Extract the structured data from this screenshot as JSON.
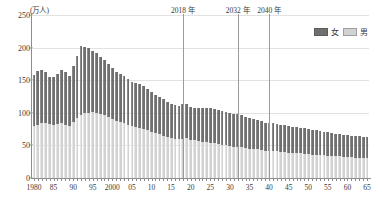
{
  "chart_data": {
    "type": "bar",
    "stacked": true,
    "title": "",
    "subtitle": "",
    "unit_label": "(万人)",
    "xlabel": "",
    "ylabel": "",
    "ylim": [
      0,
      250
    ],
    "yticks": [
      0,
      50,
      100,
      150,
      200,
      250
    ],
    "ytick_labels": [
      "0",
      "50",
      "100",
      "150",
      "200",
      "250"
    ],
    "grid": true,
    "legend_position": "top-right",
    "legend": [
      "女",
      "男"
    ],
    "colors": {
      "female": "#6f6f6f",
      "male": "#d2d2d2",
      "axis": "#8d8d8d",
      "grid": "#e2e2e2",
      "text": "#3a3a3a"
    },
    "x": [
      1980,
      1981,
      1982,
      1983,
      1984,
      1985,
      1986,
      1987,
      1988,
      1989,
      1990,
      1991,
      1992,
      1993,
      1994,
      1995,
      1996,
      1997,
      1998,
      1999,
      2000,
      2001,
      2002,
      2003,
      2004,
      2005,
      2006,
      2007,
      2008,
      2009,
      2010,
      2011,
      2012,
      2013,
      2014,
      2015,
      2016,
      2017,
      2018,
      2019,
      2020,
      2021,
      2022,
      2023,
      2024,
      2025,
      2026,
      2027,
      2028,
      2029,
      2030,
      2031,
      2032,
      2033,
      2034,
      2035,
      2036,
      2037,
      2038,
      2039,
      2040,
      2041,
      2042,
      2043,
      2044,
      2045,
      2046,
      2047,
      2048,
      2049,
      2050,
      2051,
      2052,
      2053,
      2054,
      2055,
      2056,
      2057,
      2058,
      2059,
      2060,
      2061,
      2062,
      2063,
      2064,
      2065
    ],
    "xtick_values": [
      1980,
      1985,
      1990,
      1995,
      2000,
      2005,
      2010,
      2015,
      2020,
      2025,
      2030,
      2035,
      2040,
      2045,
      2050,
      2055,
      2060,
      2065
    ],
    "xtick_labels": [
      "1980",
      "85",
      "90",
      "95",
      "2000",
      "05",
      "10",
      "15",
      "20",
      "25",
      "30",
      "35",
      "40",
      "45",
      "50",
      "55",
      "60",
      "65"
    ],
    "series": [
      {
        "name": "男",
        "key": "male",
        "values": [
          80,
          82,
          84,
          84,
          83,
          82,
          83,
          84,
          81,
          80,
          86,
          92,
          96,
          99,
          100,
          101,
          100,
          98,
          96,
          93,
          90,
          88,
          86,
          84,
          82,
          80,
          78,
          77,
          75,
          73,
          71,
          69,
          67,
          65,
          63,
          61,
          60,
          60,
          60,
          61,
          59,
          58,
          57,
          56,
          55,
          54,
          53,
          52,
          51,
          50,
          49,
          48,
          48,
          47,
          46,
          45,
          45,
          44,
          43,
          42,
          42,
          41,
          41,
          40,
          40,
          39,
          39,
          38,
          38,
          37,
          37,
          36,
          36,
          35,
          35,
          34,
          34,
          33,
          33,
          32,
          32,
          32,
          31,
          31,
          31,
          31
        ]
      },
      {
        "name": "女",
        "key": "female",
        "values": [
          78,
          82,
          81,
          79,
          72,
          73,
          77,
          81,
          81,
          77,
          86,
          95,
          106,
          102,
          99,
          94,
          91,
          88,
          85,
          82,
          79,
          75,
          73,
          72,
          70,
          68,
          67,
          67,
          66,
          63,
          61,
          59,
          57,
          56,
          54,
          53,
          52,
          51,
          53,
          52,
          50,
          50,
          50,
          51,
          52,
          53,
          53,
          53,
          52,
          51,
          50,
          50,
          50,
          49,
          48,
          47,
          46,
          45,
          44,
          43,
          43,
          43,
          42,
          42,
          41,
          41,
          40,
          40,
          39,
          39,
          38,
          38,
          37,
          37,
          36,
          36,
          35,
          35,
          34,
          34,
          34,
          33,
          33,
          33,
          32,
          32
        ]
      }
    ],
    "markers": [
      {
        "label": "2018 年",
        "year": 2018
      },
      {
        "label": "2032 年",
        "year": 2032
      },
      {
        "label": "2040 年",
        "year": 2040
      }
    ]
  }
}
